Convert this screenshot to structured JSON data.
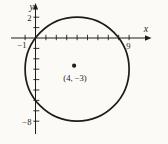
{
  "colors": {
    "ink": "#1c1c1c",
    "paper": "#fbfaf6"
  },
  "figure": {
    "x_axis_label": "x",
    "y_axis_label": "y",
    "x_tick_labels": {
      "left": "−1",
      "right": "9"
    },
    "y_tick_labels": {
      "top": "2",
      "bottom": "−8"
    },
    "x_ticks": [
      -1,
      1,
      2,
      3,
      4,
      5,
      6,
      7,
      8,
      9
    ],
    "y_ticks": [
      2,
      1,
      -1,
      -2,
      -3,
      -4,
      -5,
      -6,
      -7,
      -8
    ],
    "circle": {
      "center_x": 4,
      "center_y": -3,
      "radius": 5
    },
    "center_point_label": "(4, −3)"
  }
}
